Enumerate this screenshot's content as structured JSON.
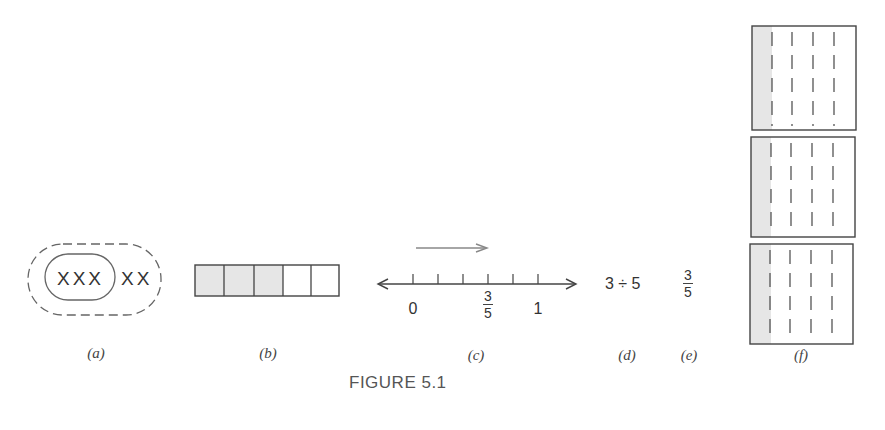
{
  "figure": {
    "caption": "FIGURE 5.1",
    "colors": {
      "line": "#444444",
      "shade": "#e6e6e6",
      "arrow_gray": "#888888"
    },
    "panels": {
      "a": {
        "label": "(a)",
        "inner_set": "XXX",
        "outer_extra": "XX",
        "description": "3 of 5 objects circled within a dashed set of 5"
      },
      "b": {
        "label": "(b)",
        "cells": 5,
        "shaded_cells": 3
      },
      "c": {
        "label": "(c)",
        "tick_count": 6,
        "label_zero": "0",
        "label_one": "1",
        "fraction_numerator": "3",
        "fraction_denominator": "5"
      },
      "d": {
        "label": "(d)",
        "expression": "3 ÷ 5"
      },
      "e": {
        "label": "(e)",
        "numerator": "3",
        "denominator": "5"
      },
      "f": {
        "label": "(f)",
        "wholes": 3,
        "parts_per_whole": 5,
        "shaded_parts_per_whole": 1
      }
    }
  }
}
